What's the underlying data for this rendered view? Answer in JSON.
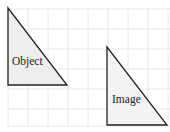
{
  "diagram": {
    "grid": {
      "spacing": 20,
      "color": "#e6e6e6"
    },
    "object": {
      "label": "Object",
      "points": "8,8 8,85 67,85",
      "fill": "#eeeeee",
      "stroke": "#222222"
    },
    "image": {
      "label": "Image",
      "points": "107,47 107,125 167,125",
      "fill": "#f4f4f4",
      "stroke": "#222222"
    }
  }
}
